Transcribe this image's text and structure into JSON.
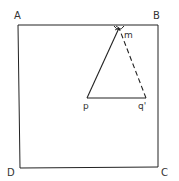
{
  "diagram": {
    "corners": {
      "A": "A",
      "B": "B",
      "C": "C",
      "D": "D"
    },
    "points": {
      "m": "m",
      "p": "p",
      "q": "q'"
    },
    "stroke_color": "#222222",
    "segments": [
      {
        "from": "m",
        "to": "p",
        "style": "solid"
      },
      {
        "from": "p",
        "to": "q'",
        "style": "solid"
      },
      {
        "from": "q'",
        "to": "m",
        "style": "dashed"
      }
    ]
  }
}
